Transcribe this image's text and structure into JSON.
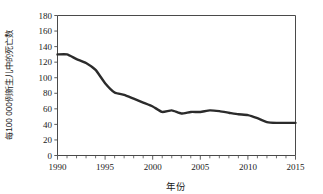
{
  "chart_data": {
    "type": "line",
    "title": "",
    "xlabel": "年份",
    "ylabel": "每100 000例新生儿中的死亡数",
    "xlim": [
      1990,
      2015
    ],
    "ylim": [
      0,
      180
    ],
    "ytick_step": 20,
    "xtick_step": 5,
    "xminor_step": 1,
    "grid": false,
    "legend": false,
    "xticks": [
      "1990",
      "1995",
      "2000",
      "2005",
      "2010",
      "2015"
    ],
    "yticks": [
      "0",
      "20",
      "40",
      "60",
      "80",
      "100",
      "120",
      "140",
      "160",
      "180"
    ],
    "x": [
      1990,
      1991,
      1992,
      1993,
      1994,
      1995,
      1996,
      1997,
      1998,
      1999,
      2000,
      2001,
      2002,
      2003,
      2004,
      2005,
      2006,
      2007,
      2008,
      2009,
      2010,
      2011,
      2012,
      2013,
      2014,
      2015
    ],
    "series": [
      {
        "name": "每100 000例新生儿中的死亡数",
        "color": "#2b2b2b",
        "values": [
          130,
          130,
          124,
          119,
          110,
          93,
          81,
          78,
          73,
          68,
          63,
          56,
          58,
          54,
          56,
          56,
          58,
          57,
          55,
          53,
          52,
          48,
          43,
          42,
          42,
          42
        ]
      }
    ]
  },
  "axis": {
    "x_title": "年份",
    "y_title": "每100 000例新生儿中的死亡数"
  },
  "colors": {
    "line": "#2b2b2b",
    "frame": "#4a4a4a",
    "text": "#1a1a1a",
    "background": "#ffffff"
  }
}
